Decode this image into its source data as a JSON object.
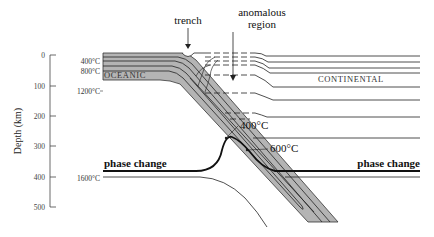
{
  "figure": {
    "type": "subduction-zone-thermal-structure",
    "axis": {
      "title": "Depth (km)",
      "ticks": [
        "0",
        "100",
        "200",
        "300",
        "400",
        "500"
      ]
    },
    "isotherm_labels_left": [
      "400°C",
      "800°C",
      "1200°C",
      "1600°C"
    ],
    "annotations": {
      "trench": "trench",
      "anomalous_region_line1": "anomalous",
      "anomalous_region_line2": "region",
      "slab_400": "400°C",
      "slab_600": "600°C"
    },
    "regions": {
      "oceanic": "OCEANIC",
      "continental": "CONTINENTAL"
    },
    "phase_change": {
      "left": "phase change",
      "right": "phase change"
    },
    "colors": {
      "slab_fill": "#b4b4b4",
      "line": "#222222",
      "background": "#ffffff"
    }
  }
}
